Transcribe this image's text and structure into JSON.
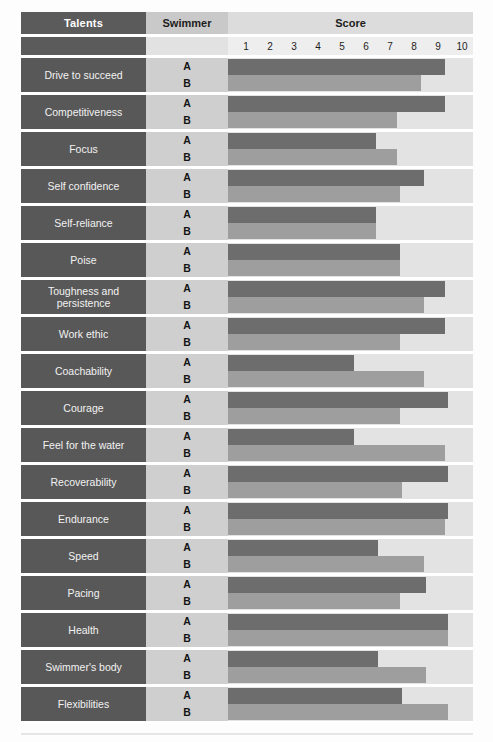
{
  "header": {
    "talents": "Talents",
    "swimmer": "Swimmer",
    "score": "Score"
  },
  "swimmer_labels": {
    "a": "A",
    "b": "B"
  },
  "colors": {
    "header_dark": "#5b5b5b",
    "header_mid": "#c9c9c9",
    "header_light": "#dcdcdc",
    "label_cell": "#585858",
    "swimmer_cell": "#cfcfcf",
    "plot_bg": "#e3e3e3",
    "bar_a": "#6d6d6d",
    "bar_b": "#9e9e9e",
    "label_text": "#f2f2f2"
  },
  "chart_data": {
    "type": "bar",
    "title": "Score",
    "xlabel": "Score",
    "ylabel": "Talents",
    "orientation": "horizontal",
    "grid": false,
    "legend": "row-labels A / B in Swimmer column",
    "xlim": [
      0,
      10
    ],
    "xticks": [
      1,
      2,
      3,
      4,
      5,
      6,
      7,
      8,
      9,
      10
    ],
    "categories": [
      "Drive to succeed",
      "Competitiveness",
      "Focus",
      "Self confidence",
      "Self-reliance",
      "Poise",
      "Toughness and persistence",
      "Work ethic",
      "Coachability",
      "Courage",
      "Feel for the water",
      "Recoverability",
      "Endurance",
      "Speed",
      "Pacing",
      "Health",
      "Swimmer's body",
      "Flexibilities"
    ],
    "series": [
      {
        "name": "A",
        "values": [
          9.3,
          9.3,
          6.4,
          8.4,
          6.4,
          7.4,
          9.3,
          9.3,
          5.5,
          9.4,
          5.5,
          9.4,
          9.4,
          6.5,
          8.5,
          9.4,
          6.5,
          7.5
        ]
      },
      {
        "name": "B",
        "values": [
          8.3,
          7.3,
          7.3,
          7.4,
          6.4,
          7.4,
          8.4,
          7.4,
          8.4,
          7.4,
          9.3,
          7.5,
          9.3,
          8.4,
          7.4,
          9.4,
          8.5,
          9.4
        ]
      }
    ]
  }
}
